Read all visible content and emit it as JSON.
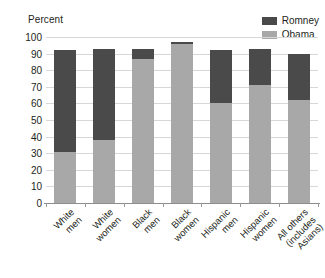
{
  "chart_data": {
    "type": "bar",
    "subtype": "stacked-bar",
    "title": "",
    "xlabel": "",
    "ylabel": "Percent",
    "ylim": [
      0,
      100
    ],
    "ytick_step": 10,
    "yticks": [
      100,
      90,
      80,
      70,
      60,
      50,
      40,
      30,
      20,
      10,
      0
    ],
    "grid": true,
    "legend_position": "top-right",
    "categories": [
      "White\nmen",
      "White\nwomen",
      "Black\nmen",
      "Black\nwomen",
      "Hispanic\nmen",
      "Hispanic\nwomen",
      "All others\n(includes\nAsians)"
    ],
    "series": [
      {
        "name": "Obama",
        "color": "#a8a8a8",
        "values": [
          31,
          38,
          87,
          96,
          60,
          71,
          62
        ]
      },
      {
        "name": "Romney",
        "color": "#4a4a4a",
        "values": [
          61,
          55,
          6,
          1,
          32,
          22,
          28
        ]
      }
    ]
  },
  "axis": {
    "percent_label": "Percent"
  },
  "colors": {
    "romney": "#4a4a4a",
    "obama": "#a8a8a8",
    "gridline": "#d7d7d7",
    "baseline": "#8d8d8d",
    "text": "#231f20",
    "background": "#ffffff"
  }
}
